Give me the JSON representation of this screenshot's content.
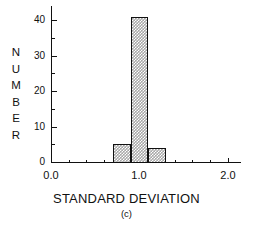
{
  "chart_data": {
    "type": "bar",
    "title": "",
    "subtitle": "(c)",
    "xlabel": "STANDARD DEVIATION",
    "ylabel": "NUMBER",
    "ylabel_letters": [
      "N",
      "U",
      "M",
      "B",
      "E",
      "R"
    ],
    "xlim": [
      0.0,
      2.15
    ],
    "ylim": [
      0,
      44
    ],
    "grid": false,
    "legend": null,
    "bar_edge_color": "#111111",
    "bar_fill_color": "#a8a8a8",
    "categories": [
      "0.7-0.9",
      "0.9-1.1",
      "1.1-1.3"
    ],
    "bin_edges": [
      0.7,
      0.9,
      1.1,
      1.3
    ],
    "values": [
      5,
      41,
      4
    ],
    "bars": [
      {
        "x_start": 0.7,
        "x_end": 0.9,
        "value": 5
      },
      {
        "x_start": 0.9,
        "x_end": 1.1,
        "value": 41
      },
      {
        "x_start": 1.1,
        "x_end": 1.3,
        "value": 4
      }
    ],
    "x_ticks_major": [
      0.0,
      1.0,
      2.0
    ],
    "x_ticks_major_labels": [
      "0.0",
      "1.0",
      "2.0"
    ],
    "x_ticks_minor": [
      0.2,
      0.4,
      0.6,
      0.8,
      1.2,
      1.4,
      1.6,
      1.8
    ],
    "y_ticks_major": [
      0,
      10,
      20,
      30,
      40
    ],
    "y_ticks_major_labels": [
      "0",
      "10",
      "20",
      "30",
      "40"
    ],
    "y_ticks_minor": [
      5,
      15,
      25,
      35
    ]
  }
}
